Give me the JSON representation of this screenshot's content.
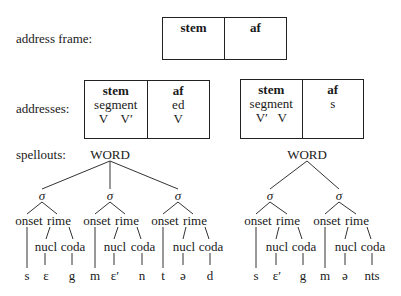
{
  "frame": {
    "label": "address frame:",
    "cols": [
      {
        "head": "stem",
        "lines": []
      },
      {
        "head": "af",
        "lines": []
      }
    ]
  },
  "addresses": {
    "label": "addresses:",
    "boxes": [
      {
        "cols": [
          {
            "head": "stem",
            "line1": "segment",
            "line2": "V    V′"
          },
          {
            "head": "af",
            "line1": "ed",
            "line2": "V"
          }
        ]
      },
      {
        "cols": [
          {
            "head": "stem",
            "line1": "segment",
            "line2": "V′   V"
          },
          {
            "head": "af",
            "line1": "s",
            "line2": ""
          }
        ]
      }
    ]
  },
  "spellouts": {
    "label": "spellouts:",
    "trees": [
      {
        "root": "WORD",
        "syllables": [
          {
            "node": "σ",
            "onset": "onset",
            "rime": "rime",
            "nucl": "nucl",
            "coda": "coda",
            "seg_onset": "s",
            "seg_nucl": "ɛ",
            "seg_coda": "g"
          },
          {
            "node": "σ",
            "onset": "onset",
            "rime": "rime",
            "nucl": "nucl",
            "coda": "coda",
            "seg_onset": "m",
            "seg_nucl": "ɛ′",
            "seg_coda": "n"
          },
          {
            "node": "σ",
            "onset": "onset",
            "rime": "rime",
            "nucl": "nucl",
            "coda": "coda",
            "seg_onset": "t",
            "seg_nucl": "ə",
            "seg_coda": "d"
          }
        ]
      },
      {
        "root": "WORD",
        "syllables": [
          {
            "node": "σ",
            "onset": "onset",
            "rime": "rime",
            "nucl": "nucl",
            "coda": "coda",
            "seg_onset": "s",
            "seg_nucl": "ɛ′",
            "seg_coda": "g"
          },
          {
            "node": "σ",
            "onset": "onset",
            "rime": "rime",
            "nucl": "nucl",
            "coda": "coda",
            "seg_onset": "m",
            "seg_nucl": "ə",
            "seg_coda": "nts"
          }
        ]
      }
    ]
  }
}
